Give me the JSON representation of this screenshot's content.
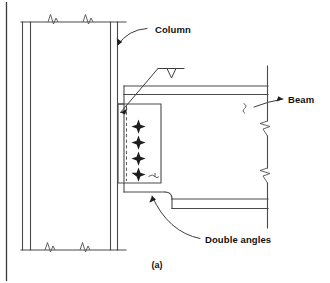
{
  "figure": {
    "caption": "(a)",
    "background_color": "#ffffff",
    "line_color": "#4a4a4a",
    "text_color": "#111111"
  },
  "labels": {
    "column": "Column",
    "beam": "Beam",
    "double_angles": "Double angles"
  },
  "annotations": {
    "weld_symbol": "bevel-groove-weld",
    "break_symbol": "break-line",
    "bolt_count": 4,
    "bolt_symbol": "bolt-cross"
  },
  "parts": [
    {
      "name": "column",
      "label": "Column",
      "orientation": "vertical",
      "break_symbols": 4
    },
    {
      "name": "beam",
      "label": "Beam",
      "orientation": "horizontal",
      "break_symbols": 3,
      "coped": true
    },
    {
      "name": "double-angles",
      "label": "Double angles",
      "fasteners": 4
    }
  ]
}
